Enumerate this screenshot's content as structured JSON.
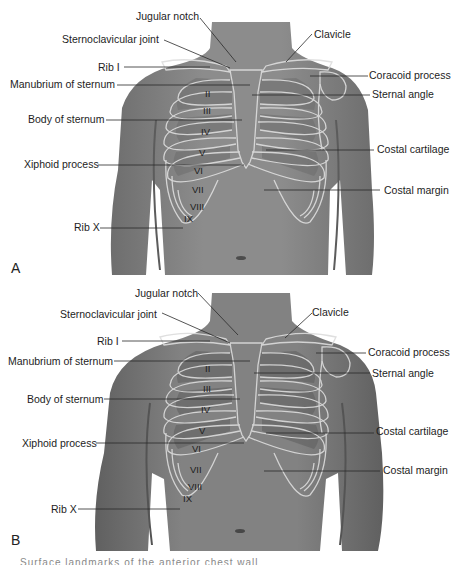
{
  "panels": [
    {
      "letter": "A",
      "labels": {
        "jugular_notch": "Jugular notch",
        "sternoclavicular_joint": "Sternoclavicular joint",
        "rib_i": "Rib I",
        "manubrium": "Manubrium of sternum",
        "body_of_sternum": "Body of sternum",
        "xiphoid": "Xiphoid process",
        "rib_x": "Rib X",
        "clavicle": "Clavicle",
        "coracoid": "Coracoid process",
        "sternal_angle": "Sternal angle",
        "costal_cartilage": "Costal cartilage",
        "costal_margin": "Costal margin"
      },
      "rib_numerals": [
        "II",
        "III",
        "IV",
        "V",
        "VI",
        "VII",
        "VIII",
        "IX"
      ]
    },
    {
      "letter": "B",
      "labels": {
        "jugular_notch": "Jugular notch",
        "sternoclavicular_joint": "Sternoclavicular joint",
        "rib_i": "Rib I",
        "manubrium": "Manubrium of sternum",
        "body_of_sternum": "Body of sternum",
        "xiphoid": "Xiphoid process",
        "rib_x": "Rib X",
        "clavicle": "Clavicle",
        "coracoid": "Coracoid process",
        "sternal_angle": "Sternal angle",
        "costal_cartilage": "Costal cartilage",
        "costal_margin": "Costal margin"
      },
      "rib_numerals": [
        "II",
        "III",
        "IV",
        "V",
        "VI",
        "VII",
        "VIII",
        "IX"
      ]
    }
  ],
  "caption": "Surface landmarks of the anterior chest wall",
  "colors": {
    "skin": "#8e8e8e",
    "skin_dark": "#6f6f6f",
    "bone_outline": "#d9d9d9",
    "leader_line": "#2a2a2a",
    "background": "#ffffff"
  }
}
